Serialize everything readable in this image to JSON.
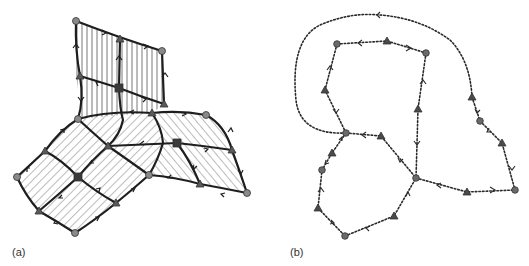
{
  "figure": {
    "panels": [
      {
        "id": "a",
        "label": "(a)",
        "description": "Quadrilateral surface mesh with three hatched sheets meeting along a seam; thick edges with arrowheads",
        "colors": {
          "edge": "#1e1e1e",
          "hatch": "#555555",
          "node_fill": "#8a8a8a",
          "tri_fill": "#5a5a5a",
          "sq_fill": "#3a3a3a"
        },
        "nodes": {
          "circles": [
            [
              76,
              21
            ],
            [
              162,
              51
            ],
            [
              78,
              119
            ],
            [
              206,
              115
            ],
            [
              17,
              177
            ],
            [
              149,
              175
            ],
            [
              247,
              193
            ],
            [
              75,
              233
            ]
          ],
          "triangles": [
            [
              120,
              39
            ],
            [
              80,
              76
            ],
            [
              164,
              104
            ],
            [
              152,
              113
            ],
            [
              108,
              146
            ],
            [
              45,
              151
            ],
            [
              200,
              184
            ],
            [
              39,
              211
            ],
            [
              116,
              203
            ],
            [
              232,
              150
            ]
          ],
          "squares": [
            [
              119,
              88
            ],
            [
              177,
              143
            ],
            [
              78,
              177
            ]
          ]
        }
      },
      {
        "id": "b",
        "label": "(b)",
        "description": "Dual graph drawn with dotted edges and open arrowheads; circle and triangle nodes",
        "colors": {
          "edge": "#2a2a2a",
          "node_fill": "#6a6a6a",
          "tri_fill": "#4a4a4a"
        },
        "nodes": {
          "circles": [
            [
              337,
              44
            ],
            [
              426,
              53
            ],
            [
              346,
              133
            ],
            [
              480,
              121
            ],
            [
              322,
              170
            ],
            [
              416,
              178
            ],
            [
              515,
              190
            ],
            [
              345,
              236
            ]
          ],
          "triangles": [
            [
              387,
              41
            ],
            [
              325,
              90
            ],
            [
              418,
              109
            ],
            [
              472,
              97
            ],
            [
              381,
              136
            ],
            [
              502,
              143
            ],
            [
              332,
              153
            ],
            [
              467,
              192
            ],
            [
              318,
              208
            ],
            [
              394,
              216
            ]
          ]
        }
      }
    ]
  }
}
